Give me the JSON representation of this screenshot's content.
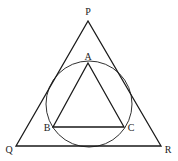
{
  "diagram": {
    "stroke_color": "#1a1a1a",
    "outer_triangle": {
      "vertices": {
        "P": {
          "label": "P",
          "x": 88,
          "y": 21,
          "label_x": 88,
          "label_y": 15
        },
        "Q": {
          "label": "Q",
          "x": 16,
          "y": 146,
          "label_x": 9,
          "label_y": 153
        },
        "R": {
          "label": "R",
          "x": 161,
          "y": 146,
          "label_x": 168,
          "label_y": 153
        }
      }
    },
    "circle": {
      "cx": 89,
      "cy": 104,
      "r": 43
    },
    "inner_triangle": {
      "vertices": {
        "A": {
          "label": "A",
          "x": 88,
          "y": 63,
          "label_x": 88,
          "label_y": 60
        },
        "B": {
          "label": "B",
          "x": 53,
          "y": 127,
          "label_x": 47,
          "label_y": 131
        },
        "C": {
          "label": "C",
          "x": 124,
          "y": 127,
          "label_x": 131,
          "label_y": 131
        }
      }
    }
  }
}
